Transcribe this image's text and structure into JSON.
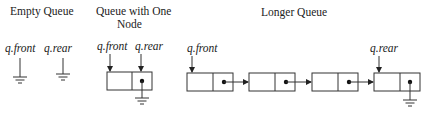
{
  "diagram": {
    "panels": [
      {
        "id": "empty",
        "title_lines": [
          "Empty Queue"
        ],
        "labels": {
          "front": "q.front",
          "rear": "q.rear"
        },
        "node_count": 0
      },
      {
        "id": "one",
        "title_lines": [
          "Queue with One",
          "Node"
        ],
        "labels": {
          "front": "q.front",
          "rear": "q.rear"
        },
        "node_count": 1
      },
      {
        "id": "longer",
        "title_lines": [
          "Longer Queue"
        ],
        "labels": {
          "front": "q.front",
          "rear": "q.rear"
        },
        "node_count": 4
      }
    ],
    "symbols": {
      "null_pointer": "ground-symbol",
      "pointer": "arrow",
      "link_dot": "filled-dot"
    },
    "colors": {
      "line": "#333333",
      "text": "#222222",
      "background": "#ffffff"
    }
  }
}
